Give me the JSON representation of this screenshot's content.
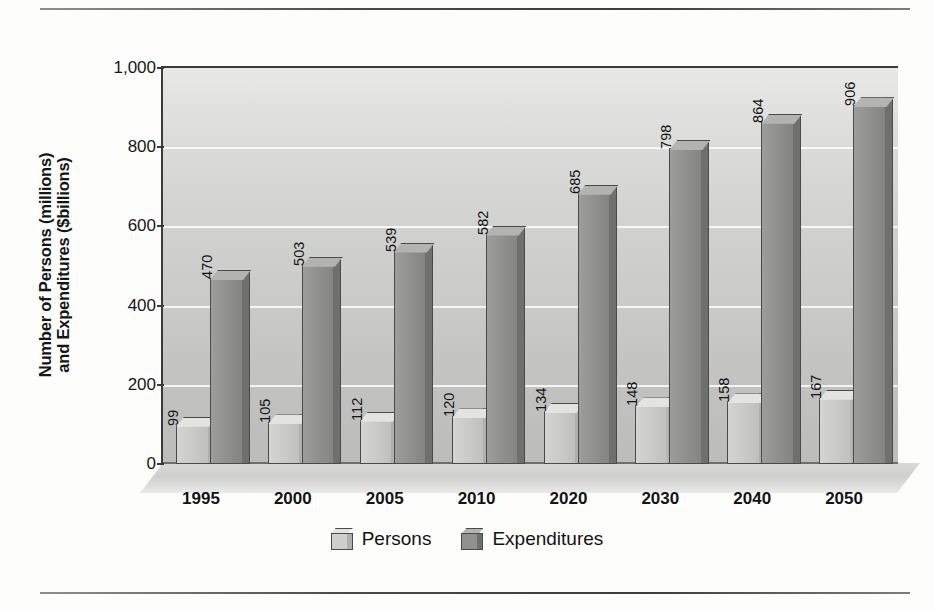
{
  "chart_data": {
    "type": "bar",
    "title": "",
    "xlabel": "",
    "ylabel": "Number of Persons (millions) and Expenditures ($billions)",
    "ylabel_lines": [
      "Number of Persons (millions)",
      "and Expenditures ($billions)"
    ],
    "categories": [
      "1995",
      "2000",
      "2005",
      "2010",
      "2020",
      "2030",
      "2040",
      "2050"
    ],
    "series": [
      {
        "name": "Persons",
        "values": [
          99,
          105,
          112,
          120,
          134,
          148,
          158,
          167
        ],
        "color": "#cbcbc9"
      },
      {
        "name": "Expenditures",
        "values": [
          470,
          503,
          539,
          582,
          685,
          798,
          864,
          906
        ],
        "color": "#919190"
      }
    ],
    "ylim": [
      0,
      1000
    ],
    "yticks": [
      0,
      200,
      400,
      600,
      800,
      1000
    ],
    "ytick_labels": [
      "0",
      "200",
      "400",
      "600",
      "800",
      "1,000"
    ],
    "grid": true,
    "legend_position": "bottom",
    "style_3d": true
  },
  "legend": {
    "items": [
      {
        "label": "Persons",
        "swatch": "persons"
      },
      {
        "label": "Expenditures",
        "swatch": "expend"
      }
    ]
  },
  "rules": {
    "top": "horizontal-rule-top",
    "bottom": "horizontal-rule-bottom"
  }
}
